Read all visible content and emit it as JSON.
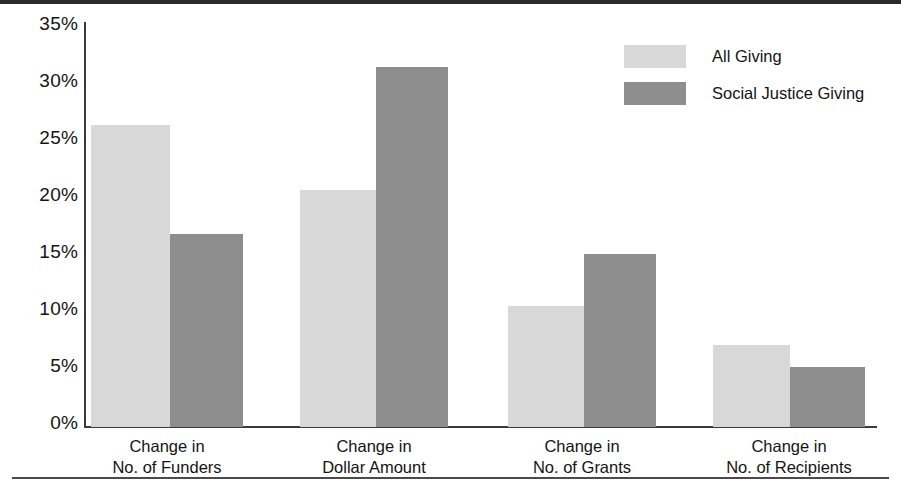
{
  "chart_data": {
    "type": "bar",
    "title": "",
    "subtitle": "",
    "xlabel": "",
    "ylabel": "",
    "categories": [
      "Change in\nNo. of Funders",
      "Change in\nDollar Amount",
      "Change in\nNo. of Grants",
      "Change in\nNo. of Recipients"
    ],
    "category_lines": [
      [
        "Change in",
        "No. of Funders"
      ],
      [
        "Change in",
        "Dollar Amount"
      ],
      [
        "Change in",
        "No. of Grants"
      ],
      [
        "Change in",
        "No. of Recipients"
      ]
    ],
    "series": [
      {
        "name": "All Giving",
        "color": "#d8d8d8",
        "values": [
          26.0,
          20.4,
          10.4,
          7.1
        ]
      },
      {
        "name": "Social Justice Giving",
        "color": "#8e8e8e",
        "values": [
          16.6,
          31.0,
          14.9,
          5.2
        ]
      }
    ],
    "ylim": [
      0,
      35
    ],
    "ytick_values": [
      0,
      5,
      10,
      15,
      20,
      25,
      30,
      35
    ],
    "ytick_labels": [
      "0%",
      "5%",
      "10%",
      "15%",
      "20%",
      "25%",
      "30%",
      "35%"
    ],
    "value_unit": "%",
    "grid": false,
    "legend_position": "top-right",
    "axis_color": "#3a3a3a"
  },
  "legend": {
    "items": [
      {
        "label": "All Giving",
        "swatch": "legend-swatch-all-giving"
      },
      {
        "label": "Social Justice Giving",
        "swatch": "legend-swatch-social-justice-giving"
      }
    ]
  },
  "ticks": {
    "t0": "0%",
    "t1": "5%",
    "t2": "10%",
    "t3": "15%",
    "t4": "20%",
    "t5": "25%",
    "t6": "30%",
    "t7": "35%"
  },
  "categories": {
    "c0l1": "Change in",
    "c0l2": "No. of Funders",
    "c1l1": "Change in",
    "c1l2": "Dollar Amount",
    "c2l1": "Change in",
    "c2l2": "No. of Grants",
    "c3l1": "Change in",
    "c3l2": "No. of Recipients"
  }
}
